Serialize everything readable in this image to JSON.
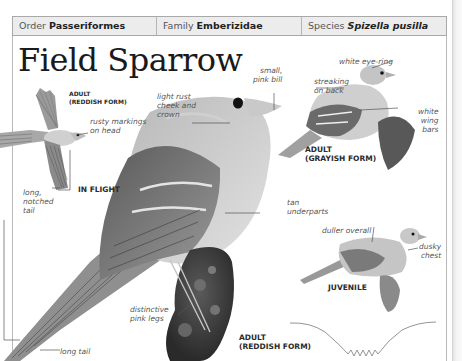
{
  "taxonomy": {
    "order_prefix": "Order",
    "order_value": "Passeriformes",
    "family_prefix": "Family",
    "family_value": "Emberizidae",
    "species_prefix": "Species",
    "species_value": "Spizella pusilla"
  },
  "title": "Field Sparrow",
  "illustrations": {
    "flight": {
      "caption_form": "ADULT\n(REDDISH FORM)",
      "caption_pose": "IN FLIGHT",
      "labels": {
        "head": "rusty markings\non head",
        "tail": "long,\nnotched\ntail"
      }
    },
    "main": {
      "caption": "ADULT\n(REDDISH FORM)",
      "labels": {
        "bill": "small,\npink bill",
        "cheek": "light rust\ncheek and\ncrown",
        "underparts": "tan\nunderparts",
        "legs": "distinctive\npink legs",
        "tail": "long tail"
      }
    },
    "grayish": {
      "caption": "ADULT\n(GRAYISH FORM)",
      "labels": {
        "eye": "white eye-ring",
        "back": "streaking\non back",
        "wing": "white\nwing\nbars"
      }
    },
    "juvenile": {
      "caption": "JUVENILE",
      "labels": {
        "overall": "duller overall",
        "chest": "dusky\nchest"
      }
    }
  },
  "flight_pattern_icon": "undulating-flight-path"
}
